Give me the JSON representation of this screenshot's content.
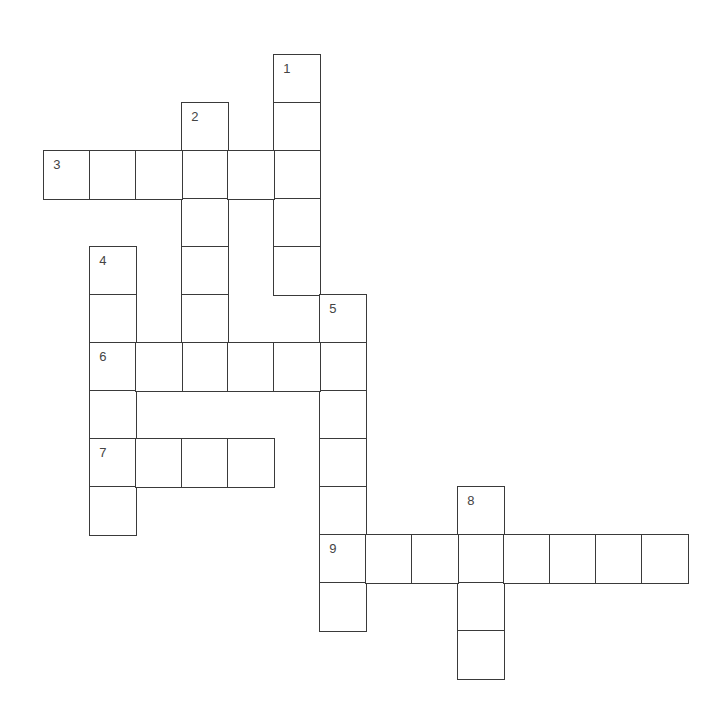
{
  "puzzle": {
    "type": "crossword",
    "cell_w": 46,
    "cell_h": 48,
    "origin_x": 44,
    "origin_y": 55,
    "line_color": "#3a3a3a",
    "words": [
      {
        "number": "1",
        "direction": "down",
        "row": 0,
        "col": 5,
        "length": 5
      },
      {
        "number": "2",
        "direction": "down",
        "row": 1,
        "col": 3,
        "length": 6
      },
      {
        "number": "3",
        "direction": "across",
        "row": 2,
        "col": 0,
        "length": 6
      },
      {
        "number": "4",
        "direction": "down",
        "row": 4,
        "col": 1,
        "length": 6
      },
      {
        "number": "5",
        "direction": "down",
        "row": 5,
        "col": 6,
        "length": 7
      },
      {
        "number": "6",
        "direction": "across",
        "row": 6,
        "col": 1,
        "length": 6
      },
      {
        "number": "7",
        "direction": "across",
        "row": 8,
        "col": 1,
        "length": 4
      },
      {
        "number": "8",
        "direction": "down",
        "row": 9,
        "col": 9,
        "length": 4
      },
      {
        "number": "9",
        "direction": "across",
        "row": 10,
        "col": 6,
        "length": 8
      }
    ]
  }
}
